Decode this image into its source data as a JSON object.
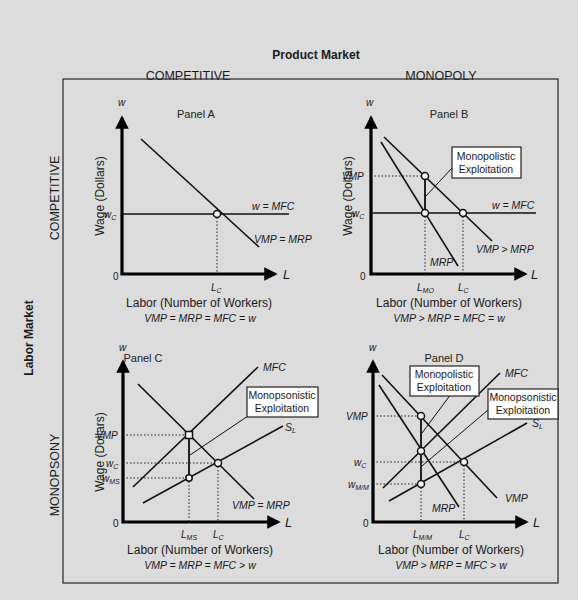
{
  "header": {
    "product_market": "Product Market",
    "labor_market": "Labor Market",
    "columns": [
      "COMPETITIVE",
      "MONOPOLY"
    ],
    "rows": [
      "COMPETITIVE",
      "MONOPSONY"
    ]
  },
  "common": {
    "y_axis_letter": "w",
    "x_axis_letter": "L",
    "y_axis_title": "Wage (Dollars)",
    "x_axis_title": "Labor (Number of Workers)",
    "origin": "0"
  },
  "panels": {
    "A": {
      "title": "Panel A",
      "curves": {
        "mfc": "w = MFC",
        "vmp": "VMP = MRP"
      },
      "y_ticks": {
        "wc": "w",
        "wc_sub": "C"
      },
      "x_ticks": {
        "lc": "L",
        "lc_sub": "C"
      },
      "equation": "VMP = MRP = MFC = w"
    },
    "B": {
      "title": "Panel B",
      "curves": {
        "mfc": "w = MFC",
        "vmp": "VMP > MRP",
        "mrp": "MRP"
      },
      "y_ticks": {
        "vmp": "VMP",
        "wc": "w",
        "wc_sub": "C"
      },
      "x_ticks": {
        "lmo": "L",
        "lmo_sub": "MO",
        "lc": "L",
        "lc_sub": "C"
      },
      "box": [
        "Monopolistic",
        "Exploitation"
      ],
      "equation": "VMP > MRP = MFC = w"
    },
    "C": {
      "title": "Panel C",
      "curves": {
        "mfc": "MFC",
        "sl": "S",
        "sl_sub": "L",
        "vmp": "VMP = MRP"
      },
      "y_ticks": {
        "vmp": "VMP",
        "wc": "w",
        "wc_sub": "C",
        "wms": "w",
        "wms_sub": "MS"
      },
      "x_ticks": {
        "lms": "L",
        "lms_sub": "MS",
        "lc": "L",
        "lc_sub": "C"
      },
      "box": [
        "Monopsonistic",
        "Exploitation"
      ],
      "equation": "VMP = MRP = MFC > w"
    },
    "D": {
      "title": "Panel D",
      "curves": {
        "mfc": "MFC",
        "sl": "S",
        "sl_sub": "L",
        "vmp": "VMP",
        "mrp": "MRP"
      },
      "y_ticks": {
        "vmp": "VMP",
        "wc": "w",
        "wc_sub": "C",
        "wmm": "w",
        "wmm_sub": "M/M"
      },
      "x_ticks": {
        "lmm": "L",
        "lmm_sub": "M/M",
        "lc": "L",
        "lc_sub": "C"
      },
      "box_left": [
        "Monopolistic",
        "Exploitation"
      ],
      "box_right": [
        "Monopsonistic",
        "Exploitation"
      ],
      "equation": "VMP > MRP = MFC > w"
    }
  }
}
